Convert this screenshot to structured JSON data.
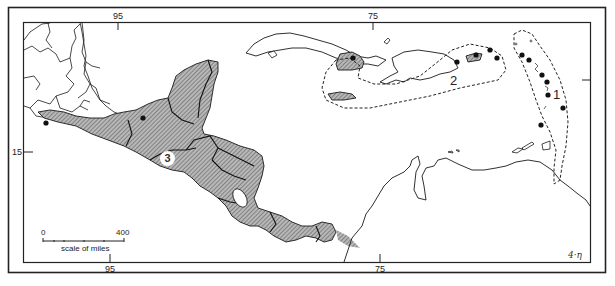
{
  "map": {
    "type": "regional distribution map",
    "region": "Central America and Caribbean",
    "longitude_ticks_top": [
      "95",
      "75"
    ],
    "longitude_ticks_bottom": [
      "95",
      "75"
    ],
    "latitude_ticks_left": [
      "15"
    ],
    "regions": [
      {
        "id": "1",
        "label": "1",
        "description": "Lesser Antilles (dashed boundary, eastern arc)"
      },
      {
        "id": "2",
        "label": "2",
        "description": "Greater Antilles: E Cuba, Jamaica, Puerto Rico (dashed boundary)"
      },
      {
        "id": "3",
        "label": "3",
        "description": "Central America mainland (hatched)",
        "circled": true
      }
    ],
    "scale_bar": {
      "start_label": "0",
      "end_label": "400",
      "caption": "scale of miles"
    },
    "signature": "4·η"
  },
  "colors": {
    "land_outline": "#1a1a1a",
    "hatched_fill": "#9a9a9a",
    "frame": "#222222",
    "background": "#ffffff"
  }
}
